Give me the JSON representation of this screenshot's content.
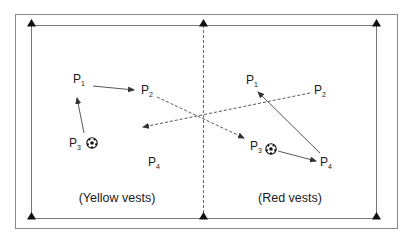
{
  "diagram": {
    "type": "soccer drill field diagram",
    "colors": {
      "line": "#555555",
      "outer_border": "#888888",
      "text": "#1a1a1a",
      "background": "#ffffff"
    },
    "outer_border": {
      "x": 15,
      "y": 14,
      "w": 382,
      "h": 214
    },
    "field": {
      "x": 31,
      "y": 25,
      "w": 345,
      "h": 193
    },
    "center_line": {
      "x": 203,
      "style": "dashed"
    },
    "cone_markers": [
      {
        "x": 31,
        "y": 25
      },
      {
        "x": 203,
        "y": 25
      },
      {
        "x": 376,
        "y": 25
      },
      {
        "x": 31,
        "y": 218
      },
      {
        "x": 203,
        "y": 218
      },
      {
        "x": 376,
        "y": 218
      }
    ],
    "teams": [
      {
        "caption": "(Yellow vests)",
        "caption_pos": {
          "x": 117,
          "y": 192
        },
        "players": [
          {
            "base": "P",
            "num": "1",
            "x": 73,
            "y": 73
          },
          {
            "base": "P",
            "num": "2",
            "x": 141,
            "y": 84
          },
          {
            "base": "P",
            "num": "3",
            "x": 69,
            "y": 137,
            "has_ball": true,
            "ball": {
              "x": 92,
              "y": 143
            }
          },
          {
            "base": "P",
            "num": "4",
            "x": 148,
            "y": 156
          }
        ]
      },
      {
        "caption": "(Red vests)",
        "caption_pos": {
          "x": 290,
          "y": 192
        },
        "players": [
          {
            "base": "P",
            "num": "1",
            "x": 246,
            "y": 74
          },
          {
            "base": "P",
            "num": "2",
            "x": 314,
            "y": 84
          },
          {
            "base": "P",
            "num": "3",
            "x": 250,
            "y": 140,
            "has_ball": true,
            "ball": {
              "x": 271,
              "y": 149
            }
          },
          {
            "base": "P",
            "num": "4",
            "x": 320,
            "y": 156
          }
        ]
      }
    ],
    "arrows": [
      {
        "from": [
          93,
          86
        ],
        "to": [
          134,
          90
        ],
        "style": "solid",
        "desc": "Yellow P1 passes to P2"
      },
      {
        "from": [
          84,
          133
        ],
        "to": [
          77,
          98
        ],
        "style": "solid",
        "desc": "Yellow P3 to P1"
      },
      {
        "from": [
          157,
          97
        ],
        "to": [
          244,
          138
        ],
        "style": "dashed",
        "desc": "Yellow P2 run to opposite half near Red P3"
      },
      {
        "from": [
          310,
          93
        ],
        "to": [
          143,
          127
        ],
        "style": "dashed",
        "desc": "Red P2 run to opposite half"
      },
      {
        "from": [
          278,
          151
        ],
        "to": [
          316,
          161
        ],
        "style": "solid",
        "desc": "Red P3 passes to P4"
      },
      {
        "from": [
          320,
          153
        ],
        "to": [
          258,
          92
        ],
        "style": "solid",
        "desc": "Red P4 to P1"
      }
    ]
  }
}
